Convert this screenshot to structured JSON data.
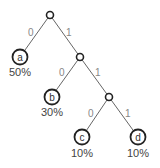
{
  "diagram": {
    "type": "huffman-tree",
    "edges": [
      {
        "from": "root",
        "to": "a",
        "bit": "0"
      },
      {
        "from": "root",
        "to": "n2",
        "bit": "1"
      },
      {
        "from": "n2",
        "to": "b",
        "bit": "0"
      },
      {
        "from": "n2",
        "to": "n3",
        "bit": "1"
      },
      {
        "from": "n3",
        "to": "c",
        "bit": "0"
      },
      {
        "from": "n3",
        "to": "d",
        "bit": "1"
      }
    ],
    "leaves": [
      {
        "symbol": "a",
        "probability": "50%"
      },
      {
        "symbol": "b",
        "probability": "30%"
      },
      {
        "symbol": "c",
        "probability": "10%"
      },
      {
        "symbol": "d",
        "probability": "10%"
      }
    ]
  }
}
